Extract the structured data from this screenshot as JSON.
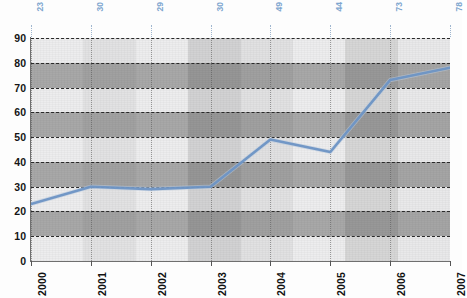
{
  "chart_data": {
    "type": "line",
    "title": "",
    "xlabel": "",
    "ylabel": "",
    "categories": [
      "2000",
      "2001",
      "2002",
      "2003",
      "2004",
      "2005",
      "2006",
      "2007"
    ],
    "values": [
      23,
      30,
      29,
      30,
      49,
      44,
      73,
      78
    ],
    "point_labels": [
      "23",
      "30",
      "29",
      "30",
      "49",
      "44",
      "73",
      "78"
    ],
    "ylim": [
      0,
      90
    ],
    "yticks": [
      "0",
      "10",
      "20",
      "30",
      "40",
      "50",
      "60",
      "70",
      "80",
      "90"
    ],
    "grid": true,
    "legend": "none",
    "series": [
      {
        "name": "series-1",
        "values": [
          23,
          30,
          29,
          30,
          49,
          44,
          73,
          78
        ]
      }
    ],
    "colors": {
      "line": "#6d93c4",
      "point_label": "#7ea6cf",
      "axis": "#6f6f6f",
      "gridline": "#2b2b2b",
      "band_light": "#ededee",
      "band_dark": "#a8a8a8",
      "plot_background": "#ececed"
    }
  },
  "axes": {
    "y_tick_labels": [
      "90",
      "80",
      "70",
      "60",
      "50",
      "40",
      "30",
      "20",
      "10",
      "0"
    ],
    "x_tick_labels": [
      "2000",
      "2001",
      "2002",
      "2003",
      "2004",
      "2005",
      "2006",
      "2007"
    ]
  },
  "top_labels": [
    "23",
    "30",
    "29",
    "30",
    "49",
    "44",
    "73",
    "78"
  ]
}
